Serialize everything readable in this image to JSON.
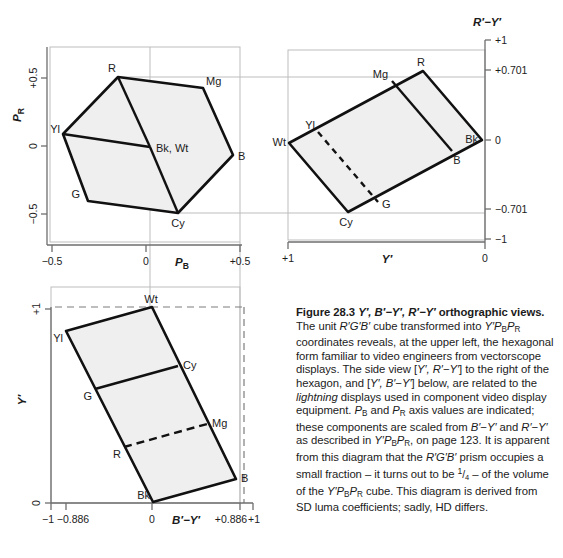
{
  "figure": {
    "number": "28.3",
    "title_plain": "Figure 28.3 Y′, B′−Y′, R′−Y′ orthographic views.",
    "caption_html": "<b>Figure 28.3 <i>Y′, B′−Y′, R′−Y′</i> orthographic views.</b> The unit <i>R′G′B′</i> cube transformed into <i>Y′P</i><span class=\"sub\">B</span><i>P</i><span class=\"sub\">R</span> coordinates reveals, at the upper left, the hexagonal form familiar to video engineers from vectorscope displays. The side view [<i>Y′, R′−Y′</i>] to the right of the hexagon, and [<i>Y′, B′−Y′</i>] below, are related to the <i>lightning</i> displays used in component video display equipment. <i>P</i><span class=\"sub\">B</span> and <i>P</i><span class=\"sub\">R</span> axis values are indicated; these components are scaled from <i>B′−Y′</i> and <i>R′−Y′</i> as described in <i>Y′P</i><span class=\"sub\">B</span><i>P</i><span class=\"sub\">R</span>, on page 123. It is apparent from this diagram that the <i>R′G′B′</i> prism occupies a small fraction – it turns out to be <span class=\"frac\"><sup>1</sup>/<span class=\"sub\">4</span></span> – of the volume of the <i>Y′P</i><span class=\"sub\">B</span><i>P</i><span class=\"sub\">R</span> cube. This diagram is derived from SD luma coefficients; sadly, HD differs."
  },
  "colors": {
    "ink": "#111111",
    "fill": "#efefef",
    "guide": "#b3b3b3",
    "axis": "#7a7a7a",
    "text": "#1b1b1b"
  },
  "panels": {
    "vectorscope": {
      "name": "Y′PBPR vectorscope hexagon",
      "xlabel": "P",
      "xlabel_sub": "B",
      "ylabel": "P",
      "ylabel_sub": "R",
      "xticks": [
        "−0.5",
        "0",
        "+0.5"
      ],
      "yticks": [
        "+0.5",
        "0",
        "−0.5"
      ],
      "vertices": [
        {
          "label": "R",
          "x": 118,
          "y": 77
        },
        {
          "label": "Mg",
          "x": 203,
          "y": 88
        },
        {
          "label": "B",
          "x": 233,
          "y": 155
        },
        {
          "label": "Cy",
          "x": 178,
          "y": 213
        },
        {
          "label": "G",
          "x": 88,
          "y": 201
        },
        {
          "label": "Yl",
          "x": 63,
          "y": 134
        },
        {
          "label": "Bk, Wt",
          "x": 150,
          "y": 147
        }
      ]
    },
    "side_view_ry": {
      "name": "[Y′, R′−Y′] side view",
      "xlabel": "Y′",
      "ylabel": "R′−Y′",
      "xticks": [
        "+1",
        "0"
      ],
      "yticks": [
        "+1",
        "+0.701",
        "0",
        "−0.701",
        "−1"
      ],
      "vertices": [
        {
          "label": "R",
          "x": 423,
          "y": 71
        },
        {
          "label": "Mg",
          "x": 392,
          "y": 81
        },
        {
          "label": "Yl",
          "x": 318,
          "y": 132
        },
        {
          "label": "Wt",
          "x": 289,
          "y": 143
        },
        {
          "label": "Cy",
          "x": 348,
          "y": 212
        },
        {
          "label": "G",
          "x": 378,
          "y": 202
        },
        {
          "label": "B",
          "x": 452,
          "y": 151
        },
        {
          "label": "Bk",
          "x": 482,
          "y": 140
        }
      ]
    },
    "side_view_by": {
      "name": "[Y′, B′−Y′] view",
      "xlabel": "B′−Y′",
      "ylabel": "Y′",
      "xticks": [
        "−1",
        "−0.886",
        "0",
        "+0.886",
        "+1"
      ],
      "yticks": [
        "+1",
        "0"
      ],
      "vertices": [
        {
          "label": "Wt",
          "x": 152,
          "y": 307
        },
        {
          "label": "Yl",
          "x": 66,
          "y": 331
        },
        {
          "label": "Cy",
          "x": 178,
          "y": 366
        },
        {
          "label": "G",
          "x": 95,
          "y": 389
        },
        {
          "label": "Mg",
          "x": 207,
          "y": 424
        },
        {
          "label": "R",
          "x": 124,
          "y": 447
        },
        {
          "label": "B",
          "x": 236,
          "y": 479
        },
        {
          "label": "Bk",
          "x": 153,
          "y": 502
        }
      ]
    }
  }
}
